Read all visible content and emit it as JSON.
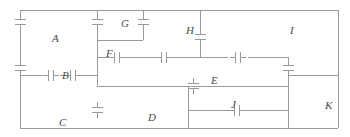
{
  "figure": {
    "kind": "capacitor-network-circuit-diagram",
    "width": 350,
    "height": 137,
    "background_color": "#ffffff",
    "wire_color": "#9a9a9a",
    "plate_color": "#9a9a9a",
    "label_color": "#4a4a4a",
    "wire_width": 1,
    "plate_width": 1.4
  },
  "labels": [
    {
      "id": "A",
      "text": "A",
      "x": 52,
      "y": 33
    },
    {
      "id": "B",
      "text": "B",
      "x": 62,
      "y": 70
    },
    {
      "id": "C",
      "text": "C",
      "x": 59,
      "y": 117
    },
    {
      "id": "D",
      "text": "D",
      "x": 148,
      "y": 112
    },
    {
      "id": "E",
      "text": "E",
      "x": 211,
      "y": 75
    },
    {
      "id": "F",
      "text": "F",
      "x": 106,
      "y": 48
    },
    {
      "id": "G",
      "text": "G",
      "x": 121,
      "y": 18
    },
    {
      "id": "H",
      "text": "H",
      "x": 186,
      "y": 25
    },
    {
      "id": "I",
      "text": "I",
      "x": 290,
      "y": 25
    },
    {
      "id": "J",
      "text": "J",
      "x": 231,
      "y": 99
    },
    {
      "id": "K",
      "text": "K",
      "x": 325,
      "y": 100
    }
  ],
  "wires": [
    {
      "id": "outer-top-rail",
      "x1": 20,
      "y1": 10,
      "x2": 338,
      "y2": 10
    },
    {
      "id": "outer-left-upper",
      "x1": 20,
      "y1": 10,
      "x2": 20,
      "y2": 16
    },
    {
      "id": "outer-left-lower",
      "x1": 20,
      "y1": 29,
      "x2": 20,
      "y2": 62
    },
    {
      "id": "outer-right-rail",
      "x1": 338,
      "y1": 10,
      "x2": 338,
      "y2": 128
    },
    {
      "id": "outer-bottom-rail",
      "x1": 20,
      "y1": 128,
      "x2": 338,
      "y2": 128
    },
    {
      "id": "left-vert-bottom",
      "x1": 20,
      "y1": 75,
      "x2": 20,
      "y2": 128
    },
    {
      "id": "mid-rail-B",
      "x1": 20,
      "y1": 75,
      "x2": 42,
      "y2": 75
    },
    {
      "id": "mid-rail-B2",
      "x1": 60,
      "y1": 75,
      "x2": 68,
      "y2": 75
    },
    {
      "id": "mid-rail-B3",
      "x1": 78,
      "y1": 75,
      "x2": 97,
      "y2": 75
    },
    {
      "id": "col-G-left-top",
      "x1": 97,
      "y1": 10,
      "x2": 97,
      "y2": 16
    },
    {
      "id": "col-G-left-down",
      "x1": 97,
      "y1": 29,
      "x2": 97,
      "y2": 40
    },
    {
      "id": "rail-F-left",
      "x1": 97,
      "y1": 40,
      "x2": 97,
      "y2": 86
    },
    {
      "id": "col-G-right-top",
      "x1": 143,
      "y1": 10,
      "x2": 143,
      "y2": 16
    },
    {
      "id": "col-G-right-down",
      "x1": 143,
      "y1": 29,
      "x2": 143,
      "y2": 40
    },
    {
      "id": "rail-G-bottom",
      "x1": 97,
      "y1": 40,
      "x2": 143,
      "y2": 40
    },
    {
      "id": "rail-F",
      "x1": 97,
      "y1": 57,
      "x2": 112,
      "y2": 57
    },
    {
      "id": "rail-F-right",
      "x1": 122,
      "y1": 57,
      "x2": 143,
      "y2": 57
    },
    {
      "id": "rail-F2",
      "x1": 143,
      "y1": 57,
      "x2": 159,
      "y2": 57
    },
    {
      "id": "rail-F3",
      "x1": 169,
      "y1": 57,
      "x2": 200,
      "y2": 57
    },
    {
      "id": "col-H-top",
      "x1": 200,
      "y1": 10,
      "x2": 200,
      "y2": 31
    },
    {
      "id": "col-H-mid",
      "x1": 200,
      "y1": 44,
      "x2": 200,
      "y2": 57
    },
    {
      "id": "rail-H-right",
      "x1": 200,
      "y1": 57,
      "x2": 228,
      "y2": 57
    },
    {
      "id": "rail-I-left",
      "x1": 248,
      "y1": 57,
      "x2": 288,
      "y2": 57
    },
    {
      "id": "col-I-down",
      "x1": 288,
      "y1": 57,
      "x2": 288,
      "y2": 62
    },
    {
      "id": "col-I-down2",
      "x1": 288,
      "y1": 75,
      "x2": 288,
      "y2": 128
    },
    {
      "id": "rail-E",
      "x1": 97,
      "y1": 86,
      "x2": 188,
      "y2": 86
    },
    {
      "id": "rail-E2",
      "x1": 198,
      "y1": 86,
      "x2": 288,
      "y2": 86
    },
    {
      "id": "rail-E-left-stub",
      "x1": 188,
      "y1": 86,
      "x2": 198,
      "y2": 86
    },
    {
      "id": "col-J-left",
      "x1": 188,
      "y1": 86,
      "x2": 188,
      "y2": 128
    },
    {
      "id": "rail-J",
      "x1": 188,
      "y1": 110,
      "x2": 232,
      "y2": 110
    },
    {
      "id": "rail-J-right",
      "x1": 242,
      "y1": 110,
      "x2": 288,
      "y2": 110
    },
    {
      "id": "rail-K-top",
      "x1": 288,
      "y1": 75,
      "x2": 338,
      "y2": 75
    }
  ],
  "capacitors": [
    {
      "id": "cap-A-upper",
      "orientation": "horizontal-plates",
      "cx": 20,
      "cy": 22,
      "label_ref": "A"
    },
    {
      "id": "cap-A-lower",
      "orientation": "horizontal-plates",
      "cx": 20,
      "cy": 68,
      "label_ref": "A"
    },
    {
      "id": "cap-B",
      "orientation": "vertical-plates",
      "cx": 51,
      "cy": 75,
      "label_ref": "B"
    },
    {
      "id": "cap-B2",
      "orientation": "vertical-plates",
      "cx": 73,
      "cy": 75,
      "label_ref": "B"
    },
    {
      "id": "cap-G-left",
      "orientation": "horizontal-plates",
      "cx": 97,
      "cy": 22,
      "label_ref": "G"
    },
    {
      "id": "cap-G-right",
      "orientation": "horizontal-plates",
      "cx": 143,
      "cy": 22,
      "label_ref": "G"
    },
    {
      "id": "cap-F",
      "orientation": "vertical-plates",
      "cx": 117,
      "cy": 57,
      "label_ref": "F"
    },
    {
      "id": "cap-F2",
      "orientation": "vertical-plates",
      "cx": 164,
      "cy": 57,
      "label_ref": "F"
    },
    {
      "id": "cap-H",
      "orientation": "horizontal-plates",
      "cx": 200,
      "cy": 37,
      "label_ref": "H"
    },
    {
      "id": "cap-I",
      "orientation": "vertical-plates",
      "cx": 238,
      "cy": 57,
      "label_ref": "I"
    },
    {
      "id": "cap-D",
      "orientation": "horizontal-plates",
      "cx": 97,
      "cy": 110,
      "label_ref": "D"
    },
    {
      "id": "cap-E",
      "orientation": "horizontal-plates",
      "cx": 193,
      "cy": 86,
      "label_ref": "E"
    },
    {
      "id": "cap-K",
      "orientation": "horizontal-plates",
      "cx": 288,
      "cy": 68,
      "label_ref": "K"
    },
    {
      "id": "cap-J",
      "orientation": "vertical-plates",
      "cx": 237,
      "cy": 110,
      "label_ref": "J"
    }
  ]
}
